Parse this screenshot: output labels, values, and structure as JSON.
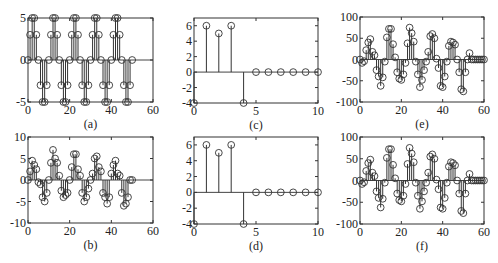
{
  "chart_data": [
    {
      "id": "a",
      "type": "stem",
      "caption": "(a)",
      "xlim": [
        0,
        60
      ],
      "ylim": [
        -5,
        5
      ],
      "xticks": [
        0,
        20,
        40,
        60
      ],
      "yticks": [
        -5,
        0,
        5
      ],
      "x": [
        0,
        1,
        2,
        3,
        4,
        5,
        6,
        7,
        8,
        9,
        10,
        11,
        12,
        13,
        14,
        15,
        16,
        17,
        18,
        19,
        20,
        21,
        22,
        23,
        24,
        25,
        26,
        27,
        28,
        29,
        30,
        31,
        32,
        33,
        34,
        35,
        36,
        37,
        38,
        39,
        40,
        41,
        42,
        43,
        44,
        45,
        46,
        47,
        48,
        49,
        50
      ],
      "y": [
        0,
        3,
        5,
        5,
        3,
        0,
        -3,
        -5,
        -5,
        -3,
        0,
        3,
        5,
        5,
        3,
        0,
        -3,
        -5,
        -5,
        -3,
        0,
        3,
        5,
        5,
        3,
        0,
        -3,
        -5,
        -5,
        -3,
        0,
        3,
        5,
        5,
        3,
        0,
        -3,
        -5,
        -5,
        -3,
        0,
        3,
        5,
        5,
        3,
        0,
        -3,
        -5,
        -5,
        -3,
        0
      ]
    },
    {
      "id": "c",
      "type": "stem",
      "caption": "(c)",
      "xlim": [
        0,
        10
      ],
      "ylim": [
        -4,
        7
      ],
      "xticks": [
        0,
        5,
        10
      ],
      "yticks": [
        -4,
        -2,
        0,
        2,
        4,
        6
      ],
      "x": [
        0,
        1,
        2,
        3,
        4,
        5,
        6,
        7,
        8,
        9,
        10
      ],
      "y": [
        -4,
        6,
        5,
        6,
        -4,
        0,
        0,
        0,
        0,
        0,
        0
      ]
    },
    {
      "id": "e",
      "type": "stem",
      "caption": "(e)",
      "xlim": [
        0,
        60
      ],
      "ylim": [
        -100,
        100
      ],
      "xticks": [
        0,
        20,
        40,
        60
      ],
      "yticks": [
        -100,
        -50,
        0,
        50,
        100
      ],
      "x": [
        0,
        1,
        2,
        3,
        4,
        5,
        6,
        7,
        8,
        9,
        10,
        11,
        12,
        13,
        14,
        15,
        16,
        17,
        18,
        19,
        20,
        21,
        22,
        23,
        24,
        25,
        26,
        27,
        28,
        29,
        30,
        31,
        32,
        33,
        34,
        35,
        36,
        37,
        38,
        39,
        40,
        41,
        42,
        43,
        44,
        45,
        46,
        47,
        48,
        49,
        50,
        51,
        52,
        53,
        54,
        55,
        56,
        57,
        58,
        59,
        60
      ],
      "y": [
        0,
        -8,
        -4,
        22,
        40,
        48,
        18,
        10,
        -25,
        -40,
        -62,
        -42,
        -5,
        52,
        72,
        72,
        36,
        5,
        -30,
        -45,
        -48,
        -35,
        -8,
        38,
        75,
        62,
        42,
        -5,
        -35,
        -65,
        -48,
        -25,
        -5,
        18,
        55,
        60,
        50,
        2,
        -20,
        -62,
        -65,
        -40,
        -5,
        32,
        42,
        40,
        35,
        0,
        -30,
        -70,
        -75,
        -30,
        0,
        15,
        0,
        0,
        0,
        0,
        0,
        0,
        0
      ]
    },
    {
      "id": "b",
      "type": "stem",
      "caption": "(b)",
      "xlim": [
        0,
        60
      ],
      "ylim": [
        -10,
        10
      ],
      "xticks": [
        0,
        20,
        40,
        60
      ],
      "yticks": [
        -10,
        -5,
        0,
        5,
        10
      ],
      "x": [
        0,
        1,
        2,
        3,
        4,
        5,
        6,
        7,
        8,
        9,
        10,
        11,
        12,
        13,
        14,
        15,
        16,
        17,
        18,
        19,
        20,
        21,
        22,
        23,
        24,
        25,
        26,
        27,
        28,
        29,
        30,
        31,
        32,
        33,
        34,
        35,
        36,
        37,
        38,
        39,
        40,
        41,
        42,
        43,
        44,
        45,
        46,
        47,
        48,
        49,
        50
      ],
      "y": [
        0,
        2,
        4.5,
        3.5,
        2.5,
        -0.5,
        -1,
        -4,
        -5,
        -3,
        0,
        4,
        7,
        5,
        4,
        1,
        -2.5,
        -4,
        -3.5,
        -3,
        0,
        3,
        6,
        6,
        2.5,
        1,
        -3,
        -5,
        -4,
        -2,
        0,
        1.5,
        5,
        5.5,
        3,
        2,
        -3,
        -4,
        -5.5,
        -4,
        1.5,
        3.5,
        4.5,
        1.5,
        1,
        -3,
        -6,
        -5.5,
        -4,
        0,
        0
      ]
    },
    {
      "id": "d",
      "type": "stem",
      "caption": "(d)",
      "xlim": [
        0,
        10
      ],
      "ylim": [
        -4,
        7
      ],
      "xticks": [
        0,
        5,
        10
      ],
      "yticks": [
        -4,
        -2,
        0,
        2,
        4,
        6
      ],
      "x": [
        0,
        1,
        2,
        3,
        4,
        5,
        6,
        7,
        8,
        9,
        10
      ],
      "y": [
        -4,
        6,
        5,
        6,
        -4,
        0,
        0,
        0,
        0,
        0,
        0
      ]
    },
    {
      "id": "f",
      "type": "stem",
      "caption": "(f)",
      "xlim": [
        0,
        60
      ],
      "ylim": [
        -100,
        100
      ],
      "xticks": [
        0,
        20,
        40,
        60
      ],
      "yticks": [
        -100,
        -50,
        0,
        50,
        100
      ],
      "x": [
        0,
        1,
        2,
        3,
        4,
        5,
        6,
        7,
        8,
        9,
        10,
        11,
        12,
        13,
        14,
        15,
        16,
        17,
        18,
        19,
        20,
        21,
        22,
        23,
        24,
        25,
        26,
        27,
        28,
        29,
        30,
        31,
        32,
        33,
        34,
        35,
        36,
        37,
        38,
        39,
        40,
        41,
        42,
        43,
        44,
        45,
        46,
        47,
        48,
        49,
        50,
        51,
        52,
        53,
        54,
        55,
        56,
        57,
        58,
        59,
        60
      ],
      "y": [
        0,
        -8,
        -4,
        22,
        40,
        48,
        18,
        10,
        -25,
        -40,
        -62,
        -42,
        -5,
        52,
        72,
        72,
        36,
        5,
        -30,
        -45,
        -48,
        -35,
        -8,
        38,
        75,
        62,
        42,
        -5,
        -35,
        -65,
        -48,
        -25,
        -5,
        18,
        55,
        60,
        50,
        2,
        -20,
        -62,
        -65,
        -40,
        -5,
        32,
        42,
        40,
        35,
        0,
        -30,
        -70,
        -75,
        -30,
        0,
        15,
        0,
        0,
        0,
        0,
        0,
        0,
        0
      ]
    }
  ]
}
